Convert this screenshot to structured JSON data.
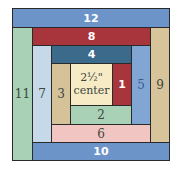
{
  "diagram": {
    "type": "log-cabin-quilt-block",
    "center": {
      "size_label": "2½\"",
      "label": "center",
      "color": "#f7ebc6"
    },
    "strips": [
      {
        "number": "1",
        "color": "#a8353b",
        "text_color": "#ffffff"
      },
      {
        "number": "2",
        "color": "#a9d1b5",
        "text_color": "#3b4740"
      },
      {
        "number": "3",
        "color": "#d6c299",
        "text_color": "#3b4740"
      },
      {
        "number": "4",
        "color": "#3b6a8b",
        "text_color": "#ffffff"
      },
      {
        "number": "5",
        "color": "#82a6d4",
        "text_color": "#3a5a8c"
      },
      {
        "number": "6",
        "color": "#f1c6c2",
        "text_color": "#3b4740"
      },
      {
        "number": "7",
        "color": "#c6d9e9",
        "text_color": "#3b4740"
      },
      {
        "number": "8",
        "color": "#a8353b",
        "text_color": "#ffffff"
      },
      {
        "number": "9",
        "color": "#d8c49b",
        "text_color": "#3b4740"
      },
      {
        "number": "10",
        "color": "#6c94c9",
        "text_color": "#ffffff"
      },
      {
        "number": "11",
        "color": "#a9d1b5",
        "text_color": "#3b4740"
      },
      {
        "number": "12",
        "color": "#6c94c9",
        "text_color": "#ffffff"
      }
    ]
  }
}
